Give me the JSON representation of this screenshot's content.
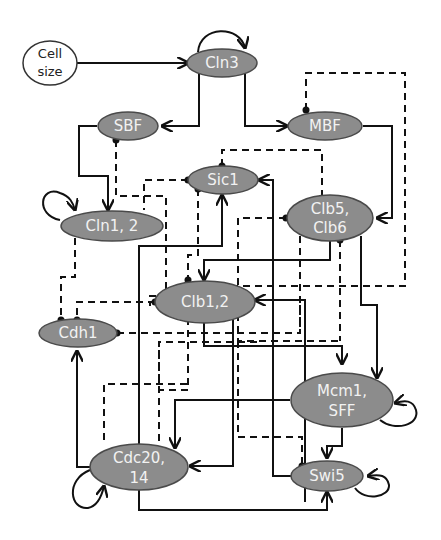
{
  "diagram": {
    "type": "boolean regulatory network",
    "legend_note": "solid arrow = activation, dashed line with dot = inhibition",
    "colors": {
      "node_fill": "#8c8c8c",
      "node_stroke": "#4a4a4a",
      "input_fill": "#ffffff",
      "edge": "#111111",
      "label": "#f2f2f2"
    },
    "nodes": [
      {
        "id": "cell_size",
        "label_line1": "Cell",
        "label_line2": "size"
      },
      {
        "id": "cln3",
        "label_line1": "Cln3"
      },
      {
        "id": "sbf",
        "label_line1": "SBF"
      },
      {
        "id": "mbf",
        "label_line1": "MBF"
      },
      {
        "id": "sic1",
        "label_line1": "Sic1"
      },
      {
        "id": "cln12",
        "label_line1": "Cln1, 2"
      },
      {
        "id": "clb56",
        "label_line1": "Clb5,",
        "label_line2": "Clb6"
      },
      {
        "id": "clb12",
        "label_line1": "Clb1,2"
      },
      {
        "id": "cdh1",
        "label_line1": "Cdh1"
      },
      {
        "id": "mcm1",
        "label_line1": "Mcm1,",
        "label_line2": "SFF"
      },
      {
        "id": "cdc20",
        "label_line1": "Cdc20,",
        "label_line2": "14"
      },
      {
        "id": "swi5",
        "label_line1": "Swi5"
      }
    ],
    "edges": [
      {
        "from": "cell_size",
        "to": "cln3",
        "type": "activation"
      },
      {
        "from": "cln3",
        "to": "cln3",
        "type": "self-loop"
      },
      {
        "from": "cln3",
        "to": "sbf",
        "type": "activation"
      },
      {
        "from": "cln3",
        "to": "mbf",
        "type": "activation"
      },
      {
        "from": "sbf",
        "to": "cln12",
        "type": "activation"
      },
      {
        "from": "mbf",
        "to": "clb56",
        "type": "activation"
      },
      {
        "from": "cln12",
        "to": "cln12",
        "type": "self-loop"
      },
      {
        "from": "clb12",
        "to": "sic1",
        "type": "inhibition"
      },
      {
        "from": "clb56",
        "to": "clb12",
        "type": "activation"
      },
      {
        "from": "clb12",
        "to": "mcm1",
        "type": "activation"
      },
      {
        "from": "clb56",
        "to": "mcm1",
        "type": "activation"
      },
      {
        "from": "mcm1",
        "to": "mcm1",
        "type": "self-loop"
      },
      {
        "from": "mcm1",
        "to": "cdc20",
        "type": "activation"
      },
      {
        "from": "mcm1",
        "to": "swi5",
        "type": "activation"
      },
      {
        "from": "cdc20",
        "to": "cdh1",
        "type": "activation"
      },
      {
        "from": "cdc20",
        "to": "sic1",
        "type": "activation"
      },
      {
        "from": "cdc20",
        "to": "swi5",
        "type": "activation"
      },
      {
        "from": "cdc20",
        "to": "cdc20",
        "type": "self-loop"
      },
      {
        "from": "swi5",
        "to": "swi5",
        "type": "self-loop"
      },
      {
        "from": "swi5",
        "to": "sic1",
        "type": "activation"
      },
      {
        "from": "clb12",
        "to": "cdc20",
        "type": "activation"
      },
      {
        "from": "clb12",
        "to": "cdh1",
        "type": "inhibition"
      },
      {
        "from": "cdh1",
        "to": "clb12",
        "type": "inhibition"
      },
      {
        "from": "clb56",
        "to": "sic1",
        "type": "inhibition"
      },
      {
        "from": "clb12",
        "to": "mbf",
        "type": "inhibition"
      },
      {
        "from": "clb12",
        "to": "sbf",
        "type": "inhibition"
      },
      {
        "from": "sic1",
        "to": "clb12",
        "type": "inhibition"
      },
      {
        "from": "sic1",
        "to": "clb56",
        "type": "inhibition"
      },
      {
        "from": "cln12",
        "to": "cdh1",
        "type": "inhibition"
      },
      {
        "from": "clb56",
        "to": "cdh1",
        "type": "inhibition"
      },
      {
        "from": "clb12",
        "to": "swi5",
        "type": "inhibition"
      },
      {
        "from": "cln12",
        "to": "sic1",
        "type": "inhibition"
      }
    ]
  }
}
